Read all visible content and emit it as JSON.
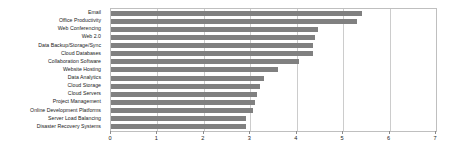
{
  "chart_data": {
    "type": "bar",
    "orientation": "horizontal",
    "title": "",
    "subtitle": "",
    "xlabel": "",
    "ylabel": "",
    "xlim": [
      0,
      7
    ],
    "ylim": null,
    "grid": true,
    "legend": null,
    "legend_position": "none",
    "xticks": [
      "0",
      "1",
      "2",
      "3",
      "4",
      "5",
      "6",
      "7"
    ],
    "xtick_values": [
      0,
      1,
      2,
      3,
      4,
      5,
      6,
      7
    ],
    "categories": [
      "Email",
      "Office Productivity",
      "Web Conferencing",
      "Web 2.0",
      "Data Backup/Storage/Sync",
      "Cloud Databases",
      "Collaboration Software",
      "Website Hosting",
      "Data Analytics",
      "Cloud Storage",
      "Cloud Servers",
      "Project Management",
      "Online Development Platforms",
      "Server Load Balancing",
      "Disaster Recovery Systems"
    ],
    "values": [
      5.4,
      5.3,
      4.45,
      4.4,
      4.35,
      4.35,
      4.05,
      3.6,
      3.3,
      3.2,
      3.15,
      3.1,
      3.05,
      2.9,
      2.9
    ],
    "series": [
      {
        "name": "",
        "values": [
          5.4,
          5.3,
          4.45,
          4.4,
          4.35,
          4.35,
          4.05,
          3.6,
          3.3,
          3.2,
          3.15,
          3.1,
          3.05,
          2.9,
          2.9
        ]
      }
    ],
    "colors": {
      "bar": "#808080",
      "gridline": "#cccccc",
      "frame": "#bfbfbf",
      "text": "#1a1a1a",
      "background": "#ffffff"
    }
  }
}
